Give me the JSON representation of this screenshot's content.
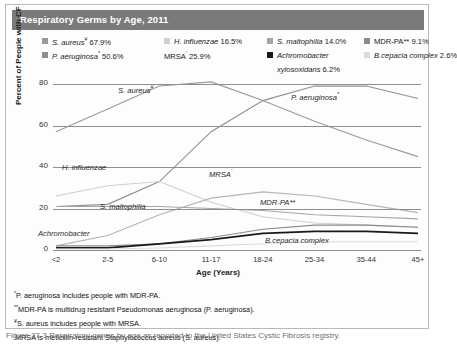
{
  "title": "Respiratory Germs by Age, 2011",
  "legend": {
    "columns": [
      {
        "left": 30,
        "items": [
          {
            "label": "S. aureus",
            "sup": "¥",
            "value": "67.9%",
            "color": "#9a9a9a",
            "swatch": true,
            "italic": true
          },
          {
            "label": "P. aeruginosa",
            "sup": "*",
            "value": "50.6%",
            "color": "#8f8f8f",
            "swatch": true,
            "italic": true
          }
        ]
      },
      {
        "left": 152,
        "items": [
          {
            "label": "H. influenzae",
            "sup": "",
            "value": "16.5%",
            "color": "#cfcfcf",
            "swatch": true,
            "italic": true
          },
          {
            "label": "MRSA",
            "sup": "'",
            "value": "25.9%",
            "color": "",
            "swatch": false,
            "italic": false
          }
        ]
      },
      {
        "left": 255,
        "items": [
          {
            "label": "S. maltophilia",
            "sup": "",
            "value": "14.0%",
            "color": "#a5a5a5",
            "swatch": true,
            "italic": true
          },
          {
            "label": "Achromobacter",
            "sup": "",
            "value": "",
            "color": "#1a1a1a",
            "swatch": true,
            "italic": true
          },
          {
            "label": "xylosoxidans",
            "sup": "",
            "value": "6.2%",
            "color": "",
            "swatch": false,
            "italic": true,
            "indent": true
          }
        ]
      },
      {
        "left": 352,
        "items": [
          {
            "label": "MDR-PA**",
            "sup": "",
            "value": "9.1%",
            "color": "#8a8a8a",
            "swatch": true,
            "italic": false
          },
          {
            "label": "B.cepacia complex",
            "sup": "",
            "value": "2.6%",
            "color": "#dcdcdc",
            "swatch": true,
            "italic": true
          }
        ]
      }
    ]
  },
  "footnotes": [
    {
      "marker": "*",
      "text": "P. aeruginosa includes people with MDR-PA."
    },
    {
      "marker": "**",
      "text": "MDR-PA is multidrug resistant Pseudomonas aeruginosa (P. aeruginosa)."
    },
    {
      "marker": "¥",
      "text": "S. aureus includes people with MRSA."
    },
    {
      "marker": "'",
      "text": "MRSA is meticillin-resistant Staphylococcus aureus (S. aureus)."
    }
  ],
  "caption": "Figure 27-3  Respiratory germs by age as reported to the United States Cystic Fibrosis registry.",
  "annotations": [
    {
      "text": "S. aureus",
      "sup": "¥",
      "x": 118,
      "y": 84
    },
    {
      "text": "P. aeruginosa",
      "sup": "*",
      "x": 291,
      "y": 91
    },
    {
      "text": "H. influenzae",
      "sup": "",
      "x": 62,
      "y": 163
    },
    {
      "text": "MRSA",
      "sup": "'",
      "x": 209,
      "y": 168
    },
    {
      "text": "S. maltophilia",
      "sup": "",
      "x": 100,
      "y": 202
    },
    {
      "text": "MDR-PA**",
      "sup": "",
      "x": 260,
      "y": 198
    },
    {
      "text": "Achromobacter",
      "sup": "",
      "x": 38,
      "y": 229
    },
    {
      "text": "B.cepacia complex",
      "sup": "",
      "x": 265,
      "y": 236
    }
  ],
  "chart_data": {
    "type": "line",
    "title": "Respiratory Germs by Age, 2011",
    "xlabel": "Age (Years)",
    "ylabel": "Percent of People with CF",
    "ylim": [
      0,
      80
    ],
    "yticks": [
      0,
      20,
      40,
      60,
      80
    ],
    "grid": true,
    "legend_position": "top",
    "categories": [
      "<2",
      "2-5",
      "6-10",
      "11-17",
      "18-24",
      "25-34",
      "35-44",
      "45+"
    ],
    "series": [
      {
        "name": "S. aureus",
        "overall": "67.9%",
        "color": "#9a9a9a",
        "values": [
          57,
          68,
          79,
          81,
          72,
          62,
          53,
          45
        ]
      },
      {
        "name": "P. aeruginosa",
        "overall": "50.6%",
        "color": "#8f8f8f",
        "values": [
          21,
          22,
          33,
          57,
          72,
          79,
          79,
          73
        ]
      },
      {
        "name": "H. influenzae",
        "overall": "16.5%",
        "color": "#cfcfcf",
        "values": [
          26,
          31,
          33,
          23,
          16,
          13,
          12,
          11
        ]
      },
      {
        "name": "MRSA",
        "overall": "25.9%",
        "color": "#b5b5b5",
        "values": [
          2,
          7,
          17,
          25,
          28,
          26,
          22,
          18
        ]
      },
      {
        "name": "S. maltophilia",
        "overall": "14.0%",
        "color": "#a5a5a5",
        "values": [
          21,
          21,
          21,
          20,
          19,
          17,
          16,
          15
        ]
      },
      {
        "name": "MDR-PA",
        "overall": "9.1%",
        "color": "#8a8a8a",
        "values": [
          2,
          2,
          3,
          6,
          10,
          12,
          12,
          11
        ]
      },
      {
        "name": "Achromobacter xylosoxidans",
        "overall": "6.2%",
        "color": "#1a1a1a",
        "values": [
          1,
          1,
          3,
          5,
          8,
          9,
          9,
          8
        ]
      },
      {
        "name": "B.cepacia complex",
        "overall": "2.6%",
        "color": "#dcdcdc",
        "values": [
          0.5,
          0.5,
          1,
          2,
          3,
          4,
          4,
          4
        ]
      }
    ]
  }
}
